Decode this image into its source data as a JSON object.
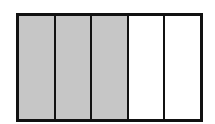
{
  "diagram": {
    "label": ")",
    "type": "fraction-bar",
    "total_parts": 5,
    "shaded_parts": 3,
    "parts": [
      {
        "index": 1,
        "shaded": true
      },
      {
        "index": 2,
        "shaded": true
      },
      {
        "index": 3,
        "shaded": true
      },
      {
        "index": 4,
        "shaded": false
      },
      {
        "index": 5,
        "shaded": false
      }
    ],
    "colors": {
      "shaded": "#c6c6c6",
      "unshaded": "#ffffff",
      "border": "#111111"
    }
  }
}
